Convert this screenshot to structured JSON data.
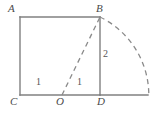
{
  "figure": {
    "stroke_color": "#808080",
    "dash_color": "#8a8a8a",
    "label_color": "#4a4a4a",
    "background": "#ffffff",
    "vertices": [
      {
        "id": "A",
        "label": "A",
        "x": 20,
        "y": 17
      },
      {
        "id": "B",
        "label": "B",
        "x": 100,
        "y": 17
      },
      {
        "id": "C",
        "label": "C",
        "x": 20,
        "y": 95
      },
      {
        "id": "O",
        "label": "O",
        "x": 62,
        "y": 95
      },
      {
        "id": "D",
        "label": "D",
        "x": 100,
        "y": 95
      }
    ],
    "measurements": [
      {
        "id": "CO",
        "label": "1",
        "segment": "C-O"
      },
      {
        "id": "OD",
        "label": "1",
        "segment": "O-D"
      },
      {
        "id": "BD",
        "label": "2",
        "segment": "B-D"
      }
    ],
    "solid_segments": [
      {
        "id": "AB",
        "from": "A",
        "to": "B"
      },
      {
        "id": "AC",
        "from": "A",
        "to": "C"
      },
      {
        "id": "CD",
        "from": "C",
        "to": "D"
      },
      {
        "id": "BD",
        "from": "B",
        "to": "D"
      },
      {
        "id": "D-axis-end",
        "from": "D",
        "to": "arc-foot"
      }
    ],
    "dashed_segments": [
      {
        "id": "OB",
        "from": "O",
        "to": "B"
      }
    ],
    "arcs": [
      {
        "id": "arc-OB",
        "center": "O",
        "from": "B",
        "to": "arc-foot",
        "style": "dashed",
        "radius_px": 87
      }
    ],
    "arc_foot": {
      "x": 147,
      "y": 95
    }
  }
}
